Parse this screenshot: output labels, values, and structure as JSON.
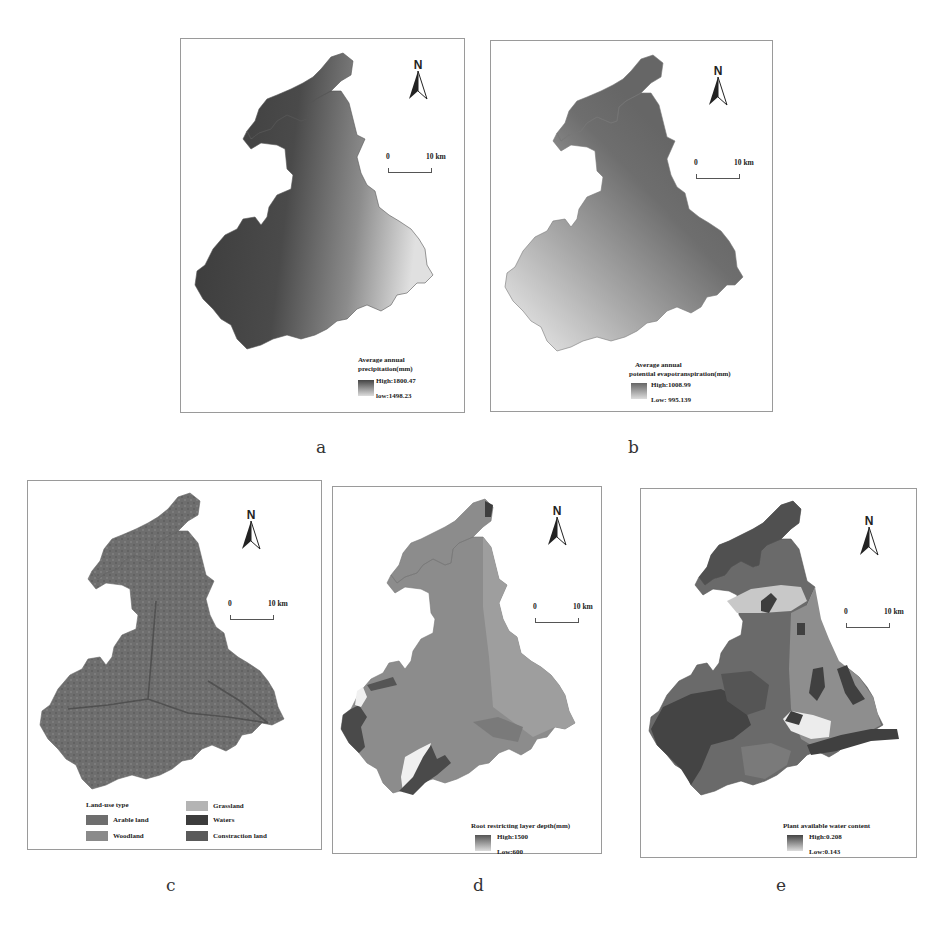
{
  "figure": {
    "panels": [
      {
        "id": "a",
        "label": "a",
        "north_label": "N",
        "scale": {
          "start": "0",
          "end": "10 km"
        },
        "legend": {
          "title_line1": "Average annual",
          "title_line2": "precipitation(mm)",
          "high": "High:1800.47",
          "low": "low:1498.23"
        },
        "colors": {
          "dark": "#3a3a3a",
          "light": "#e0e0e0"
        },
        "gradient_direction": "dark west/north-west to light east"
      },
      {
        "id": "b",
        "label": "b",
        "north_label": "N",
        "scale": {
          "start": "0",
          "end": "10 km"
        },
        "legend": {
          "title_line1": "Average annual",
          "title_line2": "potential evapotranspiration(mm)",
          "high": "High:1008.99",
          "low": "Low: 995.139"
        },
        "colors": {
          "dark": "#6a6a6a",
          "light": "#e6e6e6"
        },
        "gradient_direction": "dark north-east to light south-west"
      },
      {
        "id": "c",
        "label": "c",
        "north_label": "N",
        "scale": {
          "start": "0",
          "end": "10 km"
        },
        "legend": {
          "title": "Land-use type",
          "classes": [
            {
              "name": "Arable land",
              "color": "#6e6e6e"
            },
            {
              "name": "Grassland",
              "color": "#b4b4b4"
            },
            {
              "name": "Woodland",
              "color": "#8a8a8a"
            },
            {
              "name": "Waters",
              "color": "#3c3c3c"
            },
            {
              "name": "Constraction land",
              "color": "#5a5a5a"
            }
          ]
        }
      },
      {
        "id": "d",
        "label": "d",
        "north_label": "N",
        "scale": {
          "start": "0",
          "end": "10 km"
        },
        "legend": {
          "title_line1": "Root restricting layer depth(mm)",
          "title_line2": "",
          "high": "High:1500",
          "low": "Low:600"
        },
        "colors": {
          "base": "#8c8c8c",
          "dark": "#4a4a4a",
          "light": "#f0f0f0",
          "mid": "#9e9e9e"
        }
      },
      {
        "id": "e",
        "label": "e",
        "north_label": "N",
        "scale": {
          "start": "0",
          "end": "10 km"
        },
        "legend": {
          "title_line1": "Plant available water content",
          "title_line2": "",
          "high": "High:0.208",
          "low": "Low:0.143"
        },
        "colors": {
          "base": "#6a6a6a",
          "dark": "#404040",
          "light": "#c8c8c8",
          "lighter": "#ececec",
          "mid": "#8e8e8e"
        }
      }
    ],
    "caption": ""
  }
}
